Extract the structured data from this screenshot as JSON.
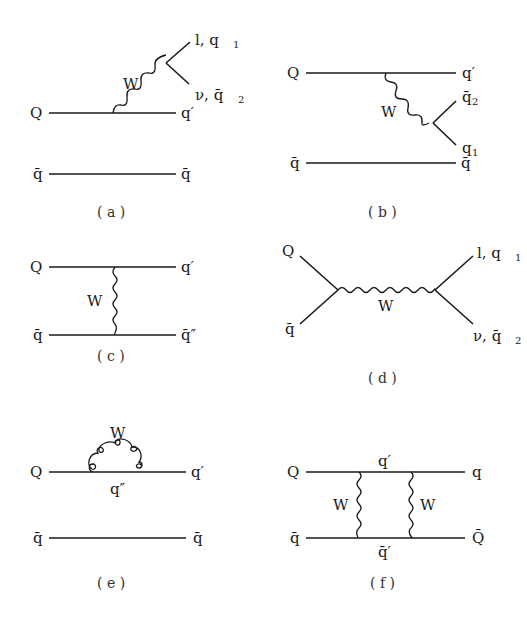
{
  "header": {
    "text": ""
  },
  "panels": [
    {
      "id": "a",
      "caption": "( a )",
      "labels": {
        "Q": "Q",
        "qprime": "q′",
        "qbar_left": "q̄",
        "qbar_right": "q̄",
        "W": "W",
        "top_out": "l, q",
        "top_sub": "1",
        "bot_out": "ν, q̄",
        "bot_sub": "2"
      }
    },
    {
      "id": "b",
      "caption": "( b )",
      "labels": {
        "Q": "Q",
        "qprime": "q′",
        "qbar_left": "q̄",
        "qbar_right": "q̄",
        "W": "W",
        "top_out": "q̄",
        "top_sub": "2",
        "bot_out": "q",
        "bot_sub": "1"
      }
    },
    {
      "id": "c",
      "caption": "( c )",
      "labels": {
        "Q": "Q",
        "qprime": "q′",
        "qbar_left": "q̄",
        "qbar_right": "q̄″",
        "W": "W"
      }
    },
    {
      "id": "d",
      "caption": "( d )",
      "labels": {
        "Q": "Q",
        "qbar_left": "q̄",
        "W": "W",
        "top_out": "l, q",
        "top_sub": "1",
        "bot_out": "ν, q̄",
        "bot_sub": "2"
      }
    },
    {
      "id": "e",
      "caption": "( e )",
      "labels": {
        "Q": "Q",
        "qprime": "q′",
        "qdoubleprime": "q″",
        "qbar_left": "q̄",
        "qbar_right": "q̄",
        "W": "W"
      }
    },
    {
      "id": "f",
      "caption": "( f )",
      "labels": {
        "Q": "Q",
        "q_right": "q",
        "qprime_top": "q′",
        "qbar_left": "q̄",
        "Qbar_right": "Q̄",
        "qbarprime_bottom": "q̄′",
        "W_left": "W",
        "W_right": "W"
      }
    }
  ]
}
